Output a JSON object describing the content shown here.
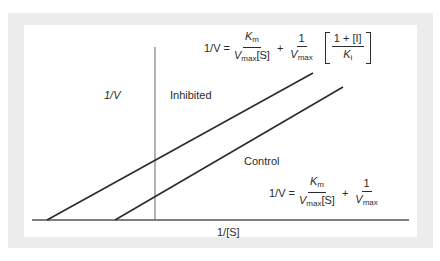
{
  "diagram": {
    "axes": {
      "y_label": "1/V",
      "x_label": "1/[S]"
    },
    "lines": [
      {
        "name": "Inhibited",
        "label": "Inhibited",
        "x1": 47,
        "y1": 220,
        "x2": 313,
        "y2": 73
      },
      {
        "name": "Control",
        "label": "Control",
        "x1": 115,
        "y1": 220,
        "x2": 343,
        "y2": 87
      }
    ],
    "equations": {
      "inhibited": {
        "lhs": "1/V =",
        "term1_num_main": "K",
        "term1_num_sub": "m",
        "term1_den_main": "V",
        "term1_den_sub": "max",
        "term1_den_tail": "[S]",
        "plus": "+",
        "term2_num": "1",
        "term2_den_main": "V",
        "term2_den_sub": "max",
        "factor_num": "1 + [I]",
        "factor_den_main": "K",
        "factor_den_sub": "i"
      },
      "control": {
        "lhs": "1/V =",
        "term1_num_main": "K",
        "term1_num_sub": "m",
        "term1_den_main": "V",
        "term1_den_sub": "max",
        "term1_den_tail": "[S]",
        "plus": "+",
        "term2_num": "1",
        "term2_den_main": "V",
        "term2_den_sub": "max"
      }
    },
    "colors": {
      "frame": "#ececec",
      "panel": "#ffffff",
      "line": "#2b2b2b",
      "axis": "#555555"
    }
  }
}
